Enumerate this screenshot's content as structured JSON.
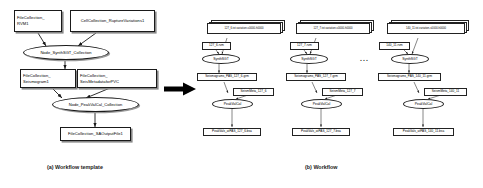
{
  "figure": {
    "captions": {
      "a": "(a) Workflow template",
      "b": "(b) Workflow"
    }
  },
  "template": {
    "nodes": {
      "file_collection_rvm": "FileCollection_\nRVM1",
      "cell_collection_rupture": "CellCollection_RuptureVariations1",
      "node_synthsgt": "Node_SynthSGT_Collection",
      "file_collection_seismogram": "FileCollection_\nSeismogram1",
      "file_collection_seismetadata": "FileCollection_\nSeisMetadataforPVC",
      "node_peakvalcal": "Node_PeakValCal_Collection",
      "file_collection_saoutput": "FileCollection_SAOutputFile1"
    }
  },
  "workflow": {
    "ellipsis": "...",
    "columns": [
      {
        "variation_stack": "127_6.txt.variation-s0000-h0000",
        "rvm": "127_6.rvm",
        "synth_node": "SynthSGT",
        "seismograms": "Seismograms_PAS_127_6.grm",
        "seismeta": "SeismMeta_127_6",
        "peak_node": "PeakValCal",
        "peakvals": "PeakVals_atPAS_127_6.bsa"
      },
      {
        "variation_stack": "127_7.txt.variation-s0000-h0000",
        "rvm": "127_7.rvm",
        "synth_node": "SynthSGT",
        "seismograms": "Seismograms_PAS_127_7.grm",
        "seismeta": "SeismMeta_127_7",
        "peak_node": "PeakValCal",
        "peakvals": "PeakVals_atPAS_127_7.bsa"
      },
      {
        "variation_stack": "140_11.txt.variation-s0000-h0000",
        "rvm": "140_11.rvm",
        "synth_node": "SynthSGT",
        "seismograms": "Seismograms_PAS_140_11.grm",
        "seismeta": "SeismMeta_140_11",
        "peak_node": "PeakValCal",
        "peakvals": "PeakVals_atPAS_140_11.bsa"
      }
    ]
  },
  "colors": {
    "stroke": "#1a1a1a",
    "shadow": "#8c8c8c",
    "background": "#ffffff",
    "arrow": "#000000"
  }
}
